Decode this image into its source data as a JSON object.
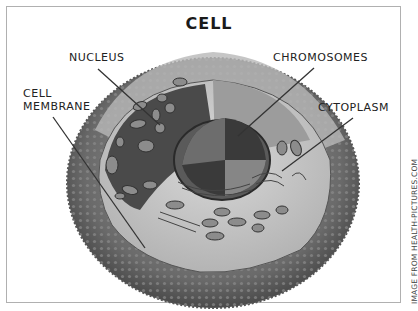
{
  "diagram": {
    "title": "CELL",
    "labels": {
      "nucleus": "NUCLEUS",
      "chromosomes": "CHROMOSOMES",
      "cell_membrane_line1": "CELL",
      "cell_membrane_line2": "MEMBRANE",
      "cytoplasm": "CYTOPLASM"
    },
    "credit": "IMAGE FROM HEALTH-PICTURES.COM",
    "colors": {
      "frame": "#b0b0b0",
      "membrane_outer": "#6e6e6e",
      "membrane_inner": "#a8a8a8",
      "cytoplasm": "#c9c9c9",
      "nucleus_dark": "#3e3e3e",
      "leader_line": "#333333"
    }
  }
}
